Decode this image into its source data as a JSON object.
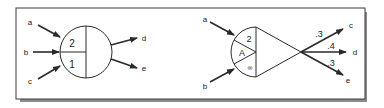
{
  "figure": {
    "colors": {
      "ink": "#2a2a2a",
      "frame": "#3a3a3a",
      "shadow": "#8c8c8c",
      "background": "#ffffff"
    },
    "left_diagram": {
      "name": "circle-node",
      "inputs": [
        "a",
        "b",
        "c"
      ],
      "outputs": [
        "d",
        "e"
      ],
      "regions": {
        "top_left": "2",
        "bottom_left": "1"
      }
    },
    "right_diagram": {
      "name": "fan-node",
      "inputs": [
        "a",
        "b"
      ],
      "regions": {
        "top": "2",
        "middle": "A",
        "bottom": "∞"
      },
      "outputs": [
        {
          "label": "c",
          "weight": ".3"
        },
        {
          "label": "d",
          "weight": ".4"
        },
        {
          "label": "e",
          "weight": ".3"
        }
      ]
    }
  }
}
